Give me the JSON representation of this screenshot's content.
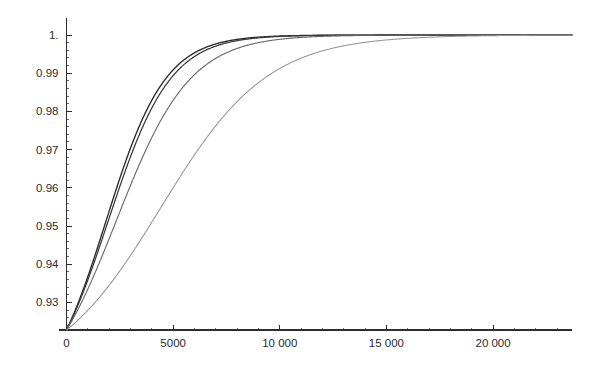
{
  "figure": {
    "name": "cdf-convergence-plot",
    "background": "#ffffff",
    "width": 599,
    "height": 374
  },
  "axes": {
    "axis_color": "#2e2e2e",
    "x_axis_name": "horizontal-axis",
    "y_axis_name": "vertical-axis"
  },
  "chart_data": {
    "type": "line",
    "title": "",
    "subtitle": "",
    "xlabel": "",
    "ylabel": "",
    "xlim": [
      0,
      23700
    ],
    "ylim": [
      0.9228,
      1.0
    ],
    "grid": false,
    "legend": null,
    "legend_position": "none",
    "x_ticks": [
      0,
      5000,
      10000,
      15000,
      20000
    ],
    "x_tick_labels": [
      "0",
      "5000",
      "10 000",
      "15 000",
      "20 000"
    ],
    "x_minor_ticks": [
      1000,
      2000,
      3000,
      4000,
      6000,
      7000,
      8000,
      9000,
      11000,
      12000,
      13000,
      14000,
      16000,
      17000,
      18000,
      19000,
      21000,
      22000,
      23000
    ],
    "y_ticks": [
      1.0,
      0.99,
      0.98,
      0.97,
      0.96,
      0.95,
      0.94,
      0.93
    ],
    "y_tick_labels": [
      "1.",
      "0.99",
      "0.98",
      "0.97",
      "0.96",
      "0.95",
      "0.94",
      "0.93"
    ],
    "y_minor_ticks": [
      0.998,
      0.996,
      0.994,
      0.992,
      0.988,
      0.986,
      0.984,
      0.982,
      0.978,
      0.976,
      0.974,
      0.972,
      0.968,
      0.966,
      0.964,
      0.962,
      0.958,
      0.956,
      0.954,
      0.952,
      0.948,
      0.946,
      0.944,
      0.942,
      0.938,
      0.936,
      0.934,
      0.932,
      0.928,
      0.926,
      0.924
    ],
    "x": [
      0,
      250,
      500,
      750,
      1000,
      1250,
      1500,
      1750,
      2000,
      2250,
      2500,
      2750,
      3000,
      3250,
      3500,
      3750,
      4000,
      4250,
      4500,
      4750,
      5000,
      5500,
      6000,
      6500,
      7000,
      7500,
      8000,
      8500,
      9000,
      9500,
      10000,
      11000,
      12000,
      13000,
      14000,
      15000,
      16000,
      18000,
      20000,
      22000,
      23700
    ],
    "series": [
      {
        "name": "curve-1",
        "color": "#2a2a2a",
        "width": 1.35,
        "x0": 1845,
        "k": 0.00072,
        "values": [
          0.9228,
          0.9228,
          0.9228,
          0.9228,
          0.9228,
          0.9228,
          0.9228,
          0.9228,
          0.9279,
          0.9455,
          0.9593,
          0.97,
          0.978,
          0.9839,
          0.9882,
          0.9913,
          0.9936,
          0.9952,
          0.9964,
          0.9973,
          0.9979,
          0.9988,
          0.9993,
          0.9996,
          0.9998,
          0.9999,
          0.9999,
          1.0,
          1.0,
          1.0,
          1.0,
          1.0,
          1.0,
          1.0,
          1.0,
          1.0,
          1.0,
          1.0,
          1.0,
          1.0,
          1.0
        ]
      },
      {
        "name": "curve-2",
        "color": "#383838",
        "width": 1.25,
        "x0": 1960,
        "k": 0.00069,
        "values": [
          0.9228,
          0.9228,
          0.9228,
          0.9228,
          0.9228,
          0.9228,
          0.9228,
          0.9228,
          0.9243,
          0.9404,
          0.9549,
          0.9667,
          0.9757,
          0.9824,
          0.9873,
          0.9909,
          0.9935,
          0.9953,
          0.9966,
          0.9976,
          0.9982,
          0.999,
          0.9994,
          0.9997,
          0.9998,
          0.9999,
          0.9999,
          1.0,
          1.0,
          1.0,
          1.0,
          1.0,
          1.0,
          1.0,
          1.0,
          1.0,
          1.0,
          1.0,
          1.0,
          1.0,
          1.0
        ]
      },
      {
        "name": "curve-3",
        "color": "#656565",
        "width": 1.1,
        "x0": 2340,
        "k": 0.00058,
        "values": [
          0.9228,
          0.9228,
          0.9228,
          0.9228,
          0.9228,
          0.9228,
          0.9228,
          0.9228,
          0.9228,
          0.9253,
          0.9394,
          0.9518,
          0.9622,
          0.9707,
          0.9775,
          0.9828,
          0.9869,
          0.99,
          0.9924,
          0.9943,
          0.9957,
          0.9975,
          0.9986,
          0.9992,
          0.9995,
          0.9997,
          0.9998,
          0.9999,
          0.9999,
          1.0,
          1.0,
          1.0,
          1.0,
          1.0,
          1.0,
          1.0,
          1.0,
          1.0,
          1.0,
          1.0,
          1.0
        ]
      },
      {
        "name": "curve-4",
        "color": "#959595",
        "width": 1.05,
        "x0": 4420,
        "k": 0.0004,
        "values": [
          0.9228,
          0.9228,
          0.9228,
          0.9228,
          0.9228,
          0.9228,
          0.9228,
          0.9228,
          0.9228,
          0.9228,
          0.9228,
          0.9228,
          0.9228,
          0.9228,
          0.9228,
          0.9228,
          0.9251,
          0.9359,
          0.9459,
          0.9549,
          0.9627,
          0.9748,
          0.9832,
          0.9889,
          0.9927,
          0.9952,
          0.9969,
          0.998,
          0.9987,
          0.9991,
          0.9994,
          0.9998,
          0.9999,
          0.9999,
          1.0,
          1.0,
          1.0,
          1.0,
          1.0,
          1.0,
          1.0
        ]
      }
    ]
  }
}
